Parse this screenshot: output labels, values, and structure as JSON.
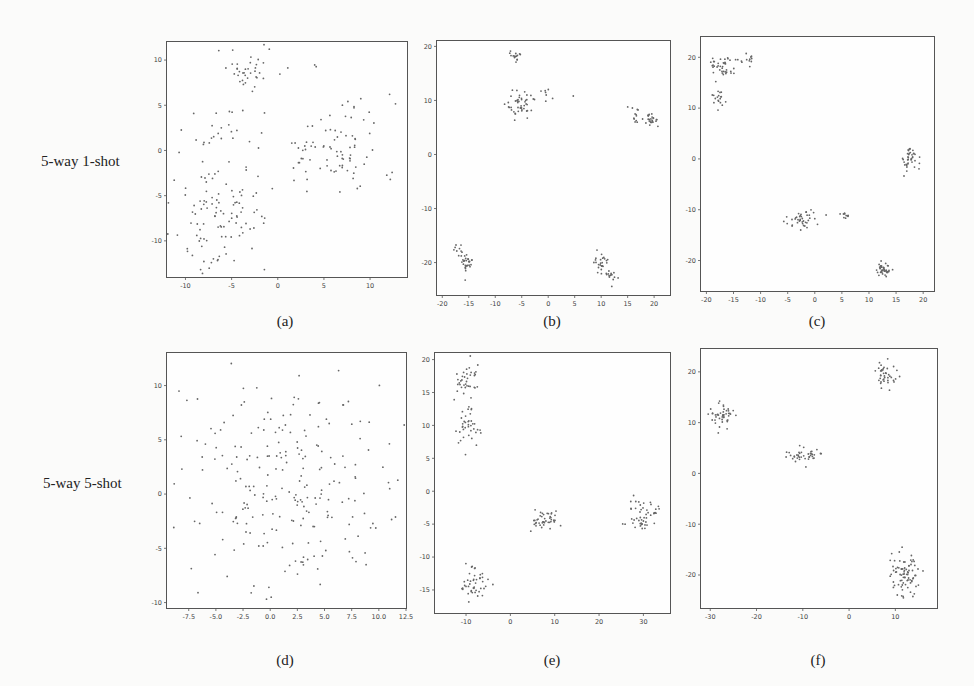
{
  "row_labels": [
    "5-way 1-shot",
    "5-way 5-shot"
  ],
  "chart_data": [
    {
      "id": "a",
      "type": "scatter",
      "caption": "(a)",
      "row": "5-way 1-shot",
      "xlim": [
        -12,
        14
      ],
      "ylim": [
        -14,
        12
      ],
      "xticks": [
        -10,
        -5,
        0,
        5,
        10
      ],
      "yticks": [
        -10,
        -5,
        0,
        5,
        10
      ],
      "grid": false,
      "clusters": [
        {
          "cx": -3,
          "cy": 9,
          "sx": 1.8,
          "sy": 1.2,
          "n": 40
        },
        {
          "cx": 6,
          "cy": 0,
          "sx": 3.5,
          "sy": 2.8,
          "n": 90
        },
        {
          "cx": -6,
          "cy": -7,
          "sx": 2.6,
          "sy": 3.2,
          "n": 110
        },
        {
          "cx": -6,
          "cy": 1.5,
          "sx": 2.5,
          "sy": 2.2,
          "n": 25
        }
      ]
    },
    {
      "id": "b",
      "type": "scatter",
      "caption": "(b)",
      "xlim": [
        -21,
        23
      ],
      "ylim": [
        -26,
        21
      ],
      "xticks": [
        -20,
        -15,
        -10,
        -5,
        0,
        5,
        10,
        15,
        20
      ],
      "yticks": [
        -20,
        -10,
        0,
        10,
        20
      ],
      "grid": false,
      "clusters": [
        {
          "cx": -6,
          "cy": 18,
          "sx": 0.6,
          "sy": 0.6,
          "n": 15
        },
        {
          "cx": -5.5,
          "cy": 9.5,
          "sx": 1.4,
          "sy": 1.2,
          "n": 45
        },
        {
          "cx": 0,
          "cy": 11,
          "sx": 1.5,
          "sy": 1.0,
          "n": 10
        },
        {
          "cx": 16.5,
          "cy": 7,
          "sx": 0.8,
          "sy": 0.8,
          "n": 12
        },
        {
          "cx": 19.5,
          "cy": 6.3,
          "sx": 0.7,
          "sy": 0.6,
          "n": 25
        },
        {
          "cx": -15.5,
          "cy": -20,
          "sx": 0.8,
          "sy": 0.8,
          "n": 30
        },
        {
          "cx": -17,
          "cy": -17.5,
          "sx": 1.0,
          "sy": 0.7,
          "n": 8
        },
        {
          "cx": 10,
          "cy": -20,
          "sx": 0.6,
          "sy": 1.0,
          "n": 25
        },
        {
          "cx": 12,
          "cy": -22.5,
          "sx": 0.6,
          "sy": 0.6,
          "n": 15
        }
      ]
    },
    {
      "id": "c",
      "type": "scatter",
      "caption": "(c)",
      "xlim": [
        -21,
        22
      ],
      "ylim": [
        -26,
        24
      ],
      "xticks": [
        -20,
        -15,
        -10,
        -5,
        0,
        5,
        10,
        15,
        20
      ],
      "yticks": [
        -20,
        -10,
        0,
        10,
        20
      ],
      "grid": false,
      "clusters": [
        {
          "cx": -17,
          "cy": 18,
          "sx": 1.3,
          "sy": 1.3,
          "n": 40
        },
        {
          "cx": -12.5,
          "cy": 19.5,
          "sx": 0.7,
          "sy": 0.8,
          "n": 12
        },
        {
          "cx": -18,
          "cy": 12,
          "sx": 0.7,
          "sy": 1.0,
          "n": 18
        },
        {
          "cx": 17.5,
          "cy": 0.3,
          "sx": 0.8,
          "sy": 1.4,
          "n": 40
        },
        {
          "cx": -2,
          "cy": -12,
          "sx": 1.5,
          "sy": 1.0,
          "n": 40
        },
        {
          "cx": 5.5,
          "cy": -11,
          "sx": 0.5,
          "sy": 0.3,
          "n": 10
        },
        {
          "cx": 12.8,
          "cy": -21.8,
          "sx": 0.6,
          "sy": 0.6,
          "n": 40
        }
      ]
    },
    {
      "id": "d",
      "type": "scatter",
      "caption": "(d)",
      "row": "5-way 5-shot",
      "xlim": [
        -9.5,
        12.5
      ],
      "ylim": [
        -10.5,
        13
      ],
      "xticks": [
        -7.5,
        -5.0,
        -2.5,
        0.0,
        2.5,
        5.0,
        7.5,
        10.0,
        12.5
      ],
      "yticks": [
        -10,
        -5,
        0,
        5,
        10
      ],
      "grid": false,
      "clusters": [
        {
          "cx": 1,
          "cy": 1,
          "sx": 5,
          "sy": 5,
          "n": 250
        }
      ]
    },
    {
      "id": "e",
      "type": "scatter",
      "caption": "(e)",
      "xlim": [
        -17,
        36
      ],
      "ylim": [
        -18.5,
        21
      ],
      "xticks": [
        -10,
        0,
        10,
        20,
        30
      ],
      "yticks": [
        -15,
        -10,
        -5,
        0,
        5,
        10,
        15,
        20
      ],
      "grid": false,
      "clusters": [
        {
          "cx": -10,
          "cy": 17,
          "sx": 1.5,
          "sy": 1.3,
          "n": 35
        },
        {
          "cx": -9.5,
          "cy": 10,
          "sx": 1.6,
          "sy": 1.6,
          "n": 40
        },
        {
          "cx": 7.5,
          "cy": -4.5,
          "sx": 1.8,
          "sy": 0.7,
          "n": 45
        },
        {
          "cx": 30,
          "cy": -3.5,
          "sx": 1.6,
          "sy": 1.3,
          "n": 50
        },
        {
          "cx": -8,
          "cy": -14,
          "sx": 1.5,
          "sy": 1.3,
          "n": 45
        }
      ]
    },
    {
      "id": "f",
      "type": "scatter",
      "caption": "(f)",
      "xlim": [
        -32,
        19
      ],
      "ylim": [
        -26.5,
        24.5
      ],
      "xticks": [
        -30,
        -20,
        -10,
        0,
        10
      ],
      "yticks": [
        -20,
        -10,
        0,
        10,
        20
      ],
      "grid": false,
      "clusters": [
        {
          "cx": -27.5,
          "cy": 11.5,
          "sx": 1.2,
          "sy": 1.2,
          "n": 45
        },
        {
          "cx": -10,
          "cy": 3.5,
          "sx": 2.0,
          "sy": 0.7,
          "n": 40
        },
        {
          "cx": 8,
          "cy": 19.5,
          "sx": 1.0,
          "sy": 1.4,
          "n": 40
        },
        {
          "cx": 12,
          "cy": -19.5,
          "sx": 1.5,
          "sy": 2.3,
          "n": 80
        }
      ]
    }
  ]
}
